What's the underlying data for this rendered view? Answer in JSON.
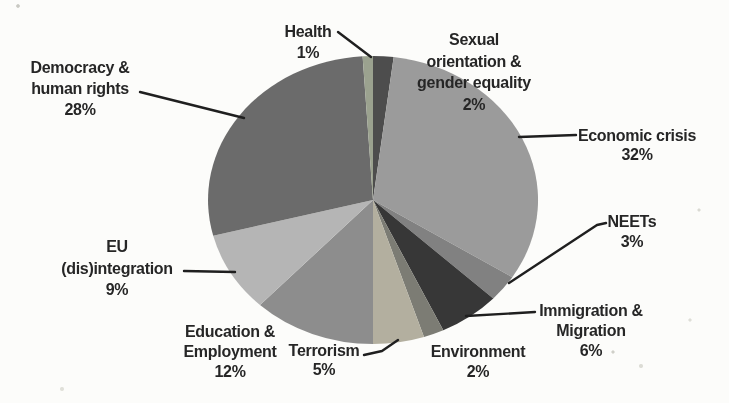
{
  "page": {
    "background": "#fcfcfa"
  },
  "chart_data": {
    "type": "pie",
    "title": "",
    "total": 100,
    "start_angle_deg": 0,
    "direction": "clockwise",
    "legend": "none",
    "slices": [
      {
        "label": "Sexual orientation & gender equality",
        "value": 2,
        "pct_label": "2%",
        "color": "#4d4d4d",
        "label_lines": [
          "Sexual",
          "orientation &",
          "gender equality",
          "2%"
        ],
        "label_pos": {
          "x": 474,
          "y": 45,
          "lh": 21.7
        },
        "leader": []
      },
      {
        "label": "Economic crisis",
        "value": 32,
        "pct_label": "32%",
        "color": "#9b9b9b",
        "label_lines": [
          "Economic crisis",
          "32%"
        ],
        "label_pos": {
          "x": 637,
          "y": 141,
          "lh": 19
        },
        "leader": [
          [
            519,
            137
          ],
          [
            576,
            135
          ]
        ]
      },
      {
        "label": "NEETs",
        "value": 3,
        "pct_label": "3%",
        "color": "#818181",
        "label_lines": [
          "NEETs",
          "3%"
        ],
        "label_pos": {
          "x": 632,
          "y": 227,
          "lh": 19.5
        },
        "leader": [
          [
            509,
            283
          ],
          [
            597,
            225
          ],
          [
            606,
            223
          ]
        ]
      },
      {
        "label": "Immigration & Migration",
        "value": 6,
        "pct_label": "6%",
        "color": "#373737",
        "label_lines": [
          "Immigration &",
          "Migration",
          "6%"
        ],
        "label_pos": {
          "x": 591,
          "y": 316,
          "lh": 20
        },
        "leader": [
          [
            466,
            316
          ],
          [
            535,
            312
          ]
        ]
      },
      {
        "label": "Environment",
        "value": 2,
        "pct_label": "2%",
        "color": "#7c7c74",
        "label_lines": [
          "Environment",
          "2%"
        ],
        "label_pos": {
          "x": 478,
          "y": 357,
          "lh": 19.5
        },
        "leader": []
      },
      {
        "label": "Terrorism",
        "value": 5,
        "pct_label": "5%",
        "color": "#b3af9f",
        "label_lines": [
          "Terrorism",
          "5%"
        ],
        "label_pos": {
          "x": 324,
          "y": 356,
          "lh": 19
        },
        "leader": [
          [
            364,
            355
          ],
          [
            382,
            351
          ],
          [
            398,
            340
          ]
        ]
      },
      {
        "label": "Education & Employment",
        "value": 12,
        "pct_label": "12%",
        "color": "#8d8d8d",
        "label_lines": [
          "Education &",
          "Employment",
          "12%"
        ],
        "label_pos": {
          "x": 230,
          "y": 337,
          "lh": 20
        },
        "leader": []
      },
      {
        "label": "EU (dis)integration",
        "value": 9,
        "pct_label": "9%",
        "color": "#b5b5b5",
        "label_lines": [
          "EU",
          "(dis)integration",
          "9%"
        ],
        "label_pos": {
          "x": 117,
          "y": 252,
          "lh": 21.5
        },
        "leader": [
          [
            184,
            271
          ],
          [
            235,
            272
          ]
        ]
      },
      {
        "label": "Democracy & human rights",
        "value": 28,
        "pct_label": "28%",
        "color": "#6b6b6b",
        "label_lines": [
          "Democracy &",
          "human rights",
          "28%"
        ],
        "label_pos": {
          "x": 80,
          "y": 73,
          "lh": 21
        },
        "leader": [
          [
            140,
            92
          ],
          [
            244,
            118
          ]
        ]
      },
      {
        "label": "Health",
        "value": 1,
        "pct_label": "1%",
        "color": "#9ba28f",
        "label_lines": [
          "Health",
          "1%"
        ],
        "label_pos": {
          "x": 308,
          "y": 37,
          "lh": 20.5
        },
        "leader": [
          [
            338,
            32
          ],
          [
            371,
            57
          ]
        ]
      }
    ]
  }
}
